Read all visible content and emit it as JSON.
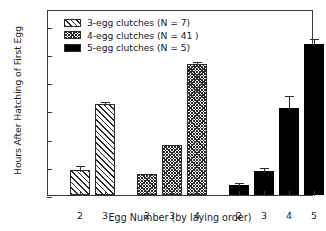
{
  "chart_data": {
    "type": "bar",
    "title": "",
    "xlabel": "Egg Number (by laying order)",
    "ylabel": "Hours After Hatching of First Egg",
    "ylim": [
      0,
      33
    ],
    "yticks": [
      0,
      5,
      10,
      15,
      20,
      25,
      30
    ],
    "grid": false,
    "legend_position": "top-left",
    "categories": [
      "2",
      "3",
      "2",
      "3",
      "4",
      "2",
      "3",
      "4",
      "5"
    ],
    "groups": [
      {
        "name": "3-egg clutches (N = 7)",
        "n": 7,
        "pattern": "diagonal-hatch",
        "color": "#ffffff",
        "x": [
          "2",
          "3"
        ],
        "values": [
          4.5,
          16.2
        ],
        "errors": [
          1.0,
          0.7
        ]
      },
      {
        "name": "4-egg clutches (N = 41 )",
        "n": 41,
        "pattern": "checker",
        "color": "#808080",
        "x": [
          "2",
          "3",
          "4"
        ],
        "values": [
          3.8,
          8.8,
          23.3
        ],
        "errors": [
          0.2,
          0.4,
          0.6
        ]
      },
      {
        "name": "5-egg clutches (N = 5)",
        "n": 5,
        "pattern": "solid",
        "color": "#000000",
        "x": [
          "2",
          "3",
          "4",
          "5"
        ],
        "values": [
          1.7,
          4.3,
          15.5,
          26.8
        ],
        "errors": [
          0.7,
          0.9,
          2.5,
          1.2
        ]
      }
    ]
  },
  "legend": {
    "entries": [
      {
        "label": "3-egg clutches (N = 7)"
      },
      {
        "label": "4-egg clutches (N = 41 )"
      },
      {
        "label": "5-egg clutches (N = 5)"
      }
    ]
  },
  "axes": {
    "y_title": "Hours After Hatching of First Egg",
    "x_title": "Egg Number (by laying order)",
    "y_tick_labels": [
      "0",
      "5",
      "10",
      "15",
      "20",
      "25",
      "30"
    ],
    "x_tick_labels": [
      "2",
      "3",
      "2",
      "3",
      "4",
      "2",
      "3",
      "4",
      "5"
    ]
  }
}
